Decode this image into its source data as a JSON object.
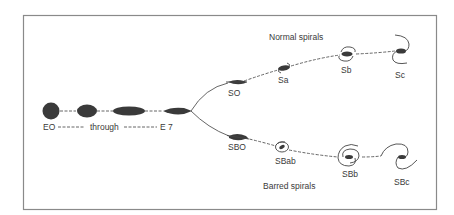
{
  "diagram": {
    "elliptical": {
      "start_label": "EO",
      "middle_label": "through",
      "end_label": "E 7"
    },
    "normal_branch": {
      "title": "Normal spirals",
      "types": [
        {
          "label": "SO"
        },
        {
          "label": "Sa"
        },
        {
          "label": "Sb"
        },
        {
          "label": "Sc"
        }
      ]
    },
    "barred_branch": {
      "title": "Barred spirals",
      "types": [
        {
          "label": "SBO"
        },
        {
          "label": "SBab"
        },
        {
          "label": "SBb"
        },
        {
          "label": "SBc"
        }
      ]
    },
    "colors": {
      "ink": "#3a3a3a",
      "frame": "#8a8a8a",
      "background": "#ffffff"
    }
  }
}
